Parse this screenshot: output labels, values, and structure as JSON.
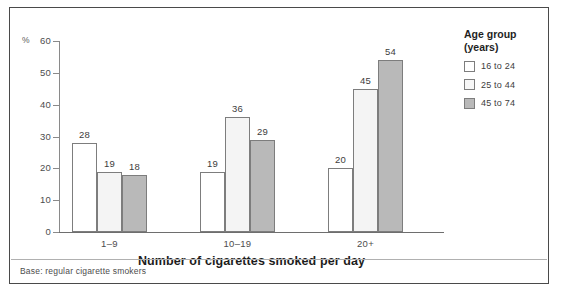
{
  "chart_data": {
    "type": "bar",
    "title": "",
    "xlabel": "Number of cigarettes smoked per day",
    "ylabel": "%",
    "ylim": [
      0,
      60
    ],
    "yticks": [
      0,
      10,
      20,
      30,
      40,
      50,
      60
    ],
    "grid": false,
    "legend_position": "right",
    "categories": [
      "1–9",
      "10–19",
      "20+"
    ],
    "series": [
      {
        "name": "16 to 24",
        "values": [
          28,
          19,
          20
        ],
        "color": "#ffffff"
      },
      {
        "name": "25 to 44",
        "values": [
          19,
          36,
          45
        ],
        "color": "#f4f4f4"
      },
      {
        "name": "45 to 74",
        "values": [
          18,
          29,
          54
        ],
        "color": "#b9b9b9"
      }
    ],
    "annotations": [
      "Base: regular cigarette smokers"
    ]
  },
  "axes": {
    "percent_symbol": "%",
    "y_tick_labels": [
      "0",
      "10",
      "20",
      "30",
      "40",
      "50",
      "60"
    ],
    "x_tick_labels": [
      "1–9",
      "10–19",
      "20+"
    ],
    "x_axis_title": "Number of cigarettes smoked per day"
  },
  "legend": {
    "title": "Age group\n(years)",
    "entries": [
      {
        "label": "16 to 24"
      },
      {
        "label": "25 to 44"
      },
      {
        "label": "45 to 74"
      }
    ]
  },
  "bar_values": {
    "g0": [
      "28",
      "19",
      "18"
    ],
    "g1": [
      "53",
      "36",
      "29"
    ],
    "g2": [
      "20",
      "45",
      "54"
    ]
  },
  "footnote": {
    "text": "Base: regular cigarette smokers"
  }
}
